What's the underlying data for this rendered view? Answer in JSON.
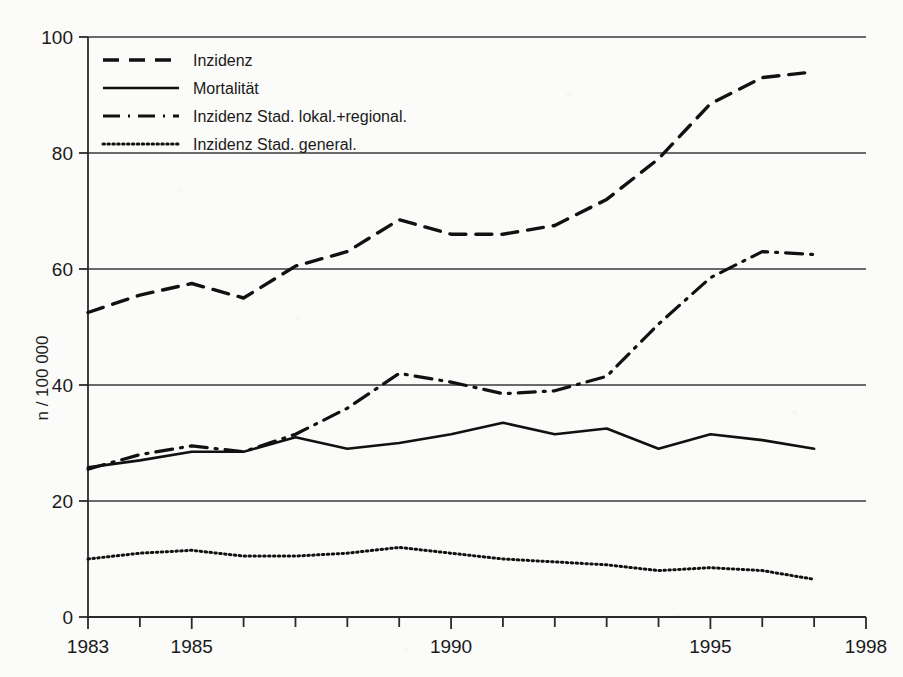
{
  "figure": {
    "background_color": "#fbfbf9",
    "ink_color": "#111111"
  },
  "axes": {
    "y_axis_title": "n / 100 000",
    "y_ticks": [
      "0",
      "20",
      "40",
      "60",
      "80",
      "100"
    ],
    "x_ticks_labeled": [
      "1983",
      "1985",
      "1990",
      "1995",
      "1998"
    ]
  },
  "legend": {
    "items": [
      {
        "label": "Inzidenz",
        "style": "dashed"
      },
      {
        "label": "Mortalität",
        "style": "solid"
      },
      {
        "label": "Inzidenz Stad. lokal.+regional.",
        "style": "dash-dot"
      },
      {
        "label": "Inzidenz Stad. general.",
        "style": "dotted"
      }
    ]
  },
  "chart_data": {
    "type": "line",
    "title": "",
    "xlabel": "",
    "ylabel": "n / 100 000",
    "xlim": [
      1983,
      1998
    ],
    "ylim": [
      0,
      100
    ],
    "grid": true,
    "legend_position": "top-left inside",
    "x": [
      1983,
      1984,
      1985,
      1986,
      1987,
      1988,
      1989,
      1990,
      1991,
      1992,
      1993,
      1994,
      1995,
      1996,
      1997
    ],
    "series": [
      {
        "name": "Inzidenz",
        "style": "dashed",
        "values": [
          52.5,
          55.5,
          57.5,
          55.0,
          60.5,
          63.0,
          68.5,
          66.0,
          66.0,
          67.5,
          72.0,
          79.0,
          88.5,
          93.0,
          94.0
        ]
      },
      {
        "name": "Mortalität",
        "style": "solid",
        "values": [
          25.8,
          27.0,
          28.5,
          28.5,
          31.0,
          29.0,
          30.0,
          31.5,
          33.5,
          31.5,
          32.5,
          29.0,
          31.5,
          30.5,
          29.0
        ]
      },
      {
        "name": "Inzidenz Stad. lokal.+regional.",
        "style": "dash-dot",
        "values": [
          25.5,
          28.0,
          29.5,
          28.5,
          31.5,
          36.0,
          42.0,
          40.5,
          38.5,
          39.0,
          41.5,
          50.5,
          58.5,
          63.0,
          62.5
        ]
      },
      {
        "name": "Inzidenz Stad. general.",
        "style": "dotted",
        "values": [
          10.0,
          11.0,
          11.5,
          10.5,
          10.5,
          11.0,
          12.0,
          11.0,
          10.0,
          9.5,
          9.0,
          8.0,
          8.5,
          8.0,
          6.5
        ]
      }
    ]
  }
}
